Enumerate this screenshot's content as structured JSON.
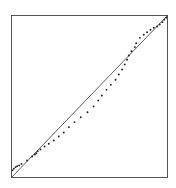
{
  "chart_data": {
    "type": "scatter",
    "subtype": "qq-plot",
    "title": "",
    "xlabel": "",
    "ylabel": "",
    "xlim": [
      0,
      1
    ],
    "ylim": [
      0,
      1
    ],
    "grid": false,
    "legend": null,
    "reference_line": {
      "from": [
        0,
        1
      ],
      "to": [
        1,
        0
      ],
      "label": "y = x"
    },
    "series": [
      {
        "name": "sample quantiles",
        "points": [
          [
            0.006,
            0.044
          ],
          [
            0.015,
            0.054
          ],
          [
            0.026,
            0.064
          ],
          [
            0.036,
            0.07
          ],
          [
            0.049,
            0.074
          ],
          [
            0.064,
            0.084
          ],
          [
            0.1,
            0.105
          ],
          [
            0.132,
            0.13
          ],
          [
            0.15,
            0.142
          ],
          [
            0.16,
            0.15
          ],
          [
            0.169,
            0.163
          ],
          [
            0.186,
            0.173
          ],
          [
            0.212,
            0.191
          ],
          [
            0.239,
            0.208
          ],
          [
            0.271,
            0.228
          ],
          [
            0.303,
            0.253
          ],
          [
            0.335,
            0.278
          ],
          [
            0.368,
            0.311
          ],
          [
            0.404,
            0.342
          ],
          [
            0.444,
            0.372
          ],
          [
            0.487,
            0.403
          ],
          [
            0.526,
            0.438
          ],
          [
            0.556,
            0.475
          ],
          [
            0.579,
            0.506
          ],
          [
            0.609,
            0.541
          ],
          [
            0.637,
            0.572
          ],
          [
            0.667,
            0.603
          ],
          [
            0.688,
            0.636
          ],
          [
            0.709,
            0.667
          ],
          [
            0.726,
            0.698
          ],
          [
            0.741,
            0.727
          ],
          [
            0.752,
            0.753
          ],
          [
            0.769,
            0.78
          ],
          [
            0.791,
            0.805
          ],
          [
            0.799,
            0.829
          ],
          [
            0.823,
            0.862
          ],
          [
            0.848,
            0.881
          ],
          [
            0.869,
            0.897
          ],
          [
            0.891,
            0.912
          ],
          [
            0.912,
            0.924
          ],
          [
            0.933,
            0.932
          ],
          [
            0.95,
            0.944
          ],
          [
            0.967,
            0.959
          ],
          [
            0.979,
            0.973
          ],
          [
            0.992,
            0.986
          ]
        ]
      }
    ]
  }
}
